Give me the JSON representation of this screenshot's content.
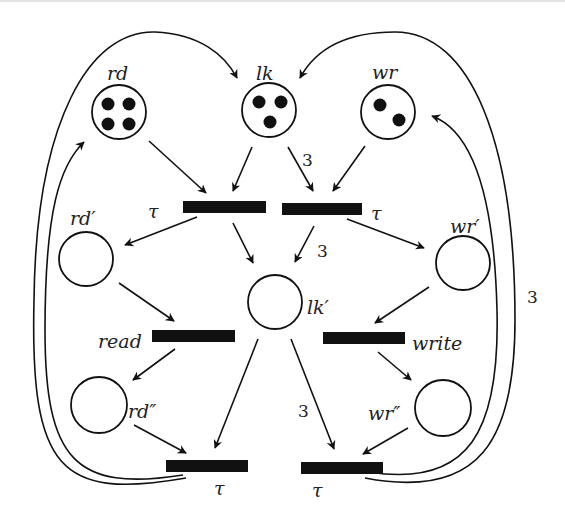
{
  "diagram": {
    "type": "petri-net",
    "places": [
      {
        "id": "rd",
        "label": "rd",
        "tokens": 4
      },
      {
        "id": "lk",
        "label": "lk",
        "tokens": 3
      },
      {
        "id": "wr",
        "label": "wr",
        "tokens": 2
      },
      {
        "id": "rd1",
        "label": "rd′",
        "tokens": 0
      },
      {
        "id": "lk1",
        "label": "lk′",
        "tokens": 0
      },
      {
        "id": "wr1",
        "label": "wr′",
        "tokens": 0
      },
      {
        "id": "rd2",
        "label": "rd″",
        "tokens": 0
      },
      {
        "id": "wr2",
        "label": "wr″",
        "tokens": 0
      }
    ],
    "transitions": [
      {
        "id": "t_top_left",
        "label": "τ"
      },
      {
        "id": "t_top_right",
        "label": "τ"
      },
      {
        "id": "t_read",
        "label": "read"
      },
      {
        "id": "t_write",
        "label": "write"
      },
      {
        "id": "t_bottom_left",
        "label": "τ"
      },
      {
        "id": "t_bottom_right",
        "label": "τ"
      }
    ],
    "arcs": [
      {
        "from": "rd",
        "to": "t_top_left",
        "weight": ""
      },
      {
        "from": "lk",
        "to": "t_top_left",
        "weight": ""
      },
      {
        "from": "lk",
        "to": "t_top_right",
        "weight": "3"
      },
      {
        "from": "wr",
        "to": "t_top_right",
        "weight": ""
      },
      {
        "from": "t_top_left",
        "to": "rd1",
        "weight": ""
      },
      {
        "from": "t_top_left",
        "to": "lk1",
        "weight": ""
      },
      {
        "from": "t_top_right",
        "to": "lk1",
        "weight": "3"
      },
      {
        "from": "t_top_right",
        "to": "wr1",
        "weight": ""
      },
      {
        "from": "rd1",
        "to": "t_read",
        "weight": ""
      },
      {
        "from": "wr1",
        "to": "t_write",
        "weight": ""
      },
      {
        "from": "t_read",
        "to": "rd2",
        "weight": ""
      },
      {
        "from": "t_write",
        "to": "wr2",
        "weight": ""
      },
      {
        "from": "rd2",
        "to": "t_bottom_left",
        "weight": ""
      },
      {
        "from": "lk1",
        "to": "t_bottom_left",
        "weight": ""
      },
      {
        "from": "lk1",
        "to": "t_bottom_right",
        "weight": "3"
      },
      {
        "from": "wr2",
        "to": "t_bottom_right",
        "weight": ""
      },
      {
        "from": "t_bottom_left",
        "to": "lk",
        "weight": ""
      },
      {
        "from": "t_bottom_left",
        "to": "rd",
        "weight": ""
      },
      {
        "from": "t_bottom_right",
        "to": "lk",
        "weight": ""
      },
      {
        "from": "t_bottom_right",
        "to": "wr",
        "weight": "3"
      }
    ],
    "weight_labels": {
      "lk_to_top_right": "3",
      "top_right_to_lk1": "3",
      "lk1_to_bottom_right": "3",
      "bottom_right_to_wr": "3"
    }
  }
}
